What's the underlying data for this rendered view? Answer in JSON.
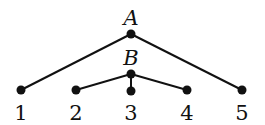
{
  "diagram": {
    "type": "tree",
    "nodes": [
      {
        "id": "A",
        "label": "A",
        "x": 131,
        "y": 34,
        "label_x": 131,
        "label_y": 18,
        "italic": true
      },
      {
        "id": "B",
        "label": "B",
        "x": 131,
        "y": 74,
        "label_x": 131,
        "label_y": 58,
        "italic": true
      },
      {
        "id": "1",
        "label": "1",
        "x": 21,
        "y": 90,
        "label_x": 21,
        "label_y": 113,
        "italic": false
      },
      {
        "id": "2",
        "label": "2",
        "x": 76,
        "y": 90,
        "label_x": 76,
        "label_y": 113,
        "italic": false
      },
      {
        "id": "3",
        "label": "3",
        "x": 131,
        "y": 91,
        "label_x": 131,
        "label_y": 113,
        "italic": false
      },
      {
        "id": "4",
        "label": "4",
        "x": 187,
        "y": 90,
        "label_x": 187,
        "label_y": 113,
        "italic": false
      },
      {
        "id": "5",
        "label": "5",
        "x": 242,
        "y": 90,
        "label_x": 242,
        "label_y": 113,
        "italic": false
      }
    ],
    "edges": [
      {
        "from": "A",
        "to": "1"
      },
      {
        "from": "A",
        "to": "5"
      },
      {
        "from": "B",
        "to": "2"
      },
      {
        "from": "B",
        "to": "3"
      },
      {
        "from": "B",
        "to": "4"
      }
    ],
    "colors": {
      "line": "#111111",
      "node": "#111111",
      "background": "#ffffff"
    }
  }
}
